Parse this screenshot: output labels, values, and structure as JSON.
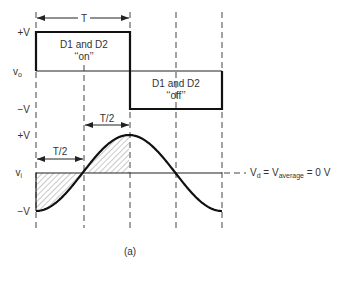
{
  "figure": {
    "caption": "(a)",
    "colors": {
      "line": "#111111",
      "text": "#333333",
      "hatch": "#777777"
    }
  },
  "top_plot": {
    "signal": "v_o",
    "signal_label_main": "v",
    "signal_label_sub": "o",
    "y_high_label": "+V",
    "y_low_label": "−V",
    "period_label": "T",
    "on_state_line1": "D1 and D2",
    "on_state_line2": "‘‘on’’",
    "off_state_line1": "D1 and D2",
    "off_state_line2": "‘‘off’’"
  },
  "bottom_plot": {
    "signal": "v_i",
    "signal_label_main": "v",
    "signal_label_sub": "i",
    "y_high_label": "+V",
    "y_low_label": "−V",
    "half_period_label_upper": "T/2",
    "half_period_label_lower": "T/2",
    "average_label": {
      "lhs_main": "V",
      "lhs_sub": "d",
      "eq1": " = ",
      "mid_main": "V",
      "mid_sub": "average",
      "rhs": " = 0 V"
    }
  },
  "chart_data": {
    "type": "line",
    "title": "",
    "series": [
      {
        "name": "v_o (square wave)",
        "x_periods": [
          0,
          0.5,
          0.5,
          1.0
        ],
        "y_norm_V": [
          1,
          1,
          -1,
          -1
        ]
      },
      {
        "name": "v_i (sinusoid, -cos)",
        "x_periods": [
          0,
          0.25,
          0.5,
          0.75,
          1.0
        ],
        "y_norm_V": [
          -1,
          0,
          1,
          0,
          -1
        ]
      }
    ],
    "xlabel": "time (periods T)",
    "ylabel": "voltage (V)",
    "ylim": [
      -1,
      1
    ],
    "annotations": [
      "T",
      "T/2",
      "T/2",
      "D1 and D2 on",
      "D1 and D2 off",
      "Vd = Vaverage = 0 V"
    ]
  }
}
